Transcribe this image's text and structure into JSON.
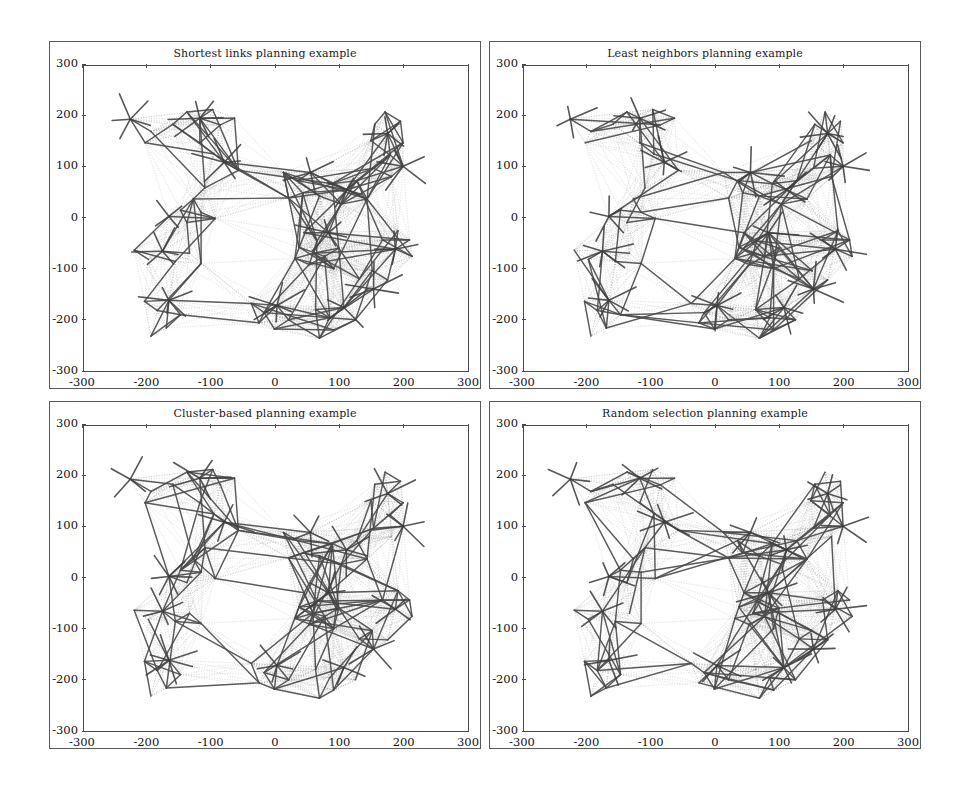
{
  "figure": {
    "width": 961,
    "height": 792,
    "background": "#ffffff",
    "line_color_solid": "#4a4a4a",
    "line_color_dotted": "#8d8d8d",
    "axis_color": "#4a4a4a"
  },
  "panels": [
    {
      "id": "shortest-links",
      "title": "Shortest links planning example",
      "position": "top-left"
    },
    {
      "id": "least-neighbors",
      "title": "Least neighbors planning example",
      "position": "top-right"
    },
    {
      "id": "cluster-based",
      "title": "Cluster-based planning example",
      "position": "bottom-left"
    },
    {
      "id": "random-selection",
      "title": "Random selection planning example",
      "position": "bottom-right"
    }
  ],
  "axes": {
    "xticks": [
      -300,
      -200,
      -100,
      0,
      100,
      200,
      300
    ],
    "yticks": [
      300,
      200,
      100,
      0,
      -100,
      -200,
      -300
    ],
    "xtick_labels": [
      "-300",
      "-200",
      "-100",
      "0",
      "100",
      "200",
      "300"
    ],
    "ytick_labels": [
      "300",
      "200",
      "100",
      "0",
      "-100",
      "-200",
      "-300"
    ],
    "xlim": [
      -300,
      300
    ],
    "ylim": [
      -300,
      300
    ],
    "xlabel": "",
    "ylabel": "",
    "grid": false
  },
  "chart_data": {
    "type": "scatter",
    "subtitle": "",
    "xlabel": "",
    "ylabel": "",
    "xlim": [
      -300,
      300
    ],
    "ylim": [
      -300,
      300
    ],
    "grid": false,
    "legend": "none",
    "nodes": [
      {
        "id": 0,
        "x": -228,
        "y": 196,
        "cluster": 0
      },
      {
        "id": 1,
        "x": -196,
        "y": 172,
        "cluster": 0
      },
      {
        "id": 2,
        "x": -205,
        "y": 150,
        "cluster": 0
      },
      {
        "id": 3,
        "x": -162,
        "y": 186,
        "cluster": 0
      },
      {
        "id": 4,
        "x": -140,
        "y": 210,
        "cluster": 1
      },
      {
        "id": 5,
        "x": -120,
        "y": 198,
        "cluster": 1
      },
      {
        "id": 6,
        "x": -100,
        "y": 215,
        "cluster": 1
      },
      {
        "id": 7,
        "x": -88,
        "y": 185,
        "cluster": 1
      },
      {
        "id": 8,
        "x": -66,
        "y": 198,
        "cluster": 1
      },
      {
        "id": 9,
        "x": -120,
        "y": 150,
        "cluster": 1
      },
      {
        "id": 10,
        "x": -98,
        "y": 128,
        "cluster": 2
      },
      {
        "id": 11,
        "x": -82,
        "y": 112,
        "cluster": 2
      },
      {
        "id": 12,
        "x": -60,
        "y": 96,
        "cluster": 2
      },
      {
        "id": 13,
        "x": -112,
        "y": 62,
        "cluster": 3
      },
      {
        "id": 14,
        "x": -130,
        "y": 40,
        "cluster": 3
      },
      {
        "id": 15,
        "x": -150,
        "y": 18,
        "cluster": 3
      },
      {
        "id": 16,
        "x": -168,
        "y": 6,
        "cluster": 3
      },
      {
        "id": 17,
        "x": -140,
        "y": -6,
        "cluster": 3
      },
      {
        "id": 18,
        "x": -118,
        "y": 14,
        "cluster": 3
      },
      {
        "id": 19,
        "x": -96,
        "y": 2,
        "cluster": 3
      },
      {
        "id": 20,
        "x": -222,
        "y": -60,
        "cluster": 4
      },
      {
        "id": 21,
        "x": -200,
        "y": -78,
        "cluster": 4
      },
      {
        "id": 22,
        "x": -178,
        "y": -62,
        "cluster": 4
      },
      {
        "id": 23,
        "x": -158,
        "y": -82,
        "cluster": 4
      },
      {
        "id": 24,
        "x": -136,
        "y": -66,
        "cluster": 4
      },
      {
        "id": 25,
        "x": -118,
        "y": -86,
        "cluster": 4
      },
      {
        "id": 26,
        "x": -206,
        "y": -160,
        "cluster": 5
      },
      {
        "id": 27,
        "x": -186,
        "y": -178,
        "cluster": 5
      },
      {
        "id": 28,
        "x": -168,
        "y": -158,
        "cluster": 5
      },
      {
        "id": 29,
        "x": -150,
        "y": -186,
        "cluster": 5
      },
      {
        "id": 30,
        "x": -172,
        "y": -212,
        "cluster": 5
      },
      {
        "id": 31,
        "x": -196,
        "y": -228,
        "cluster": 5
      },
      {
        "id": 32,
        "x": -40,
        "y": -164,
        "cluster": 6
      },
      {
        "id": 33,
        "x": -20,
        "y": -182,
        "cluster": 6
      },
      {
        "id": 34,
        "x": 0,
        "y": -168,
        "cluster": 6
      },
      {
        "id": 35,
        "x": 18,
        "y": -196,
        "cluster": 6
      },
      {
        "id": 36,
        "x": -4,
        "y": -214,
        "cluster": 6
      },
      {
        "id": 37,
        "x": -28,
        "y": -202,
        "cluster": 6
      },
      {
        "id": 38,
        "x": 60,
        "y": -176,
        "cluster": 7
      },
      {
        "id": 39,
        "x": 82,
        "y": -192,
        "cluster": 7
      },
      {
        "id": 40,
        "x": 104,
        "y": -172,
        "cluster": 7
      },
      {
        "id": 41,
        "x": 88,
        "y": -216,
        "cluster": 7
      },
      {
        "id": 42,
        "x": 66,
        "y": -232,
        "cluster": 7
      },
      {
        "id": 43,
        "x": 122,
        "y": -196,
        "cluster": 7
      },
      {
        "id": 44,
        "x": 10,
        "y": 92,
        "cluster": 8
      },
      {
        "id": 45,
        "x": 32,
        "y": 76,
        "cluster": 8
      },
      {
        "id": 46,
        "x": 52,
        "y": 92,
        "cluster": 8
      },
      {
        "id": 47,
        "x": 40,
        "y": 52,
        "cluster": 8
      },
      {
        "id": 48,
        "x": 18,
        "y": 42,
        "cluster": 8
      },
      {
        "id": 49,
        "x": 66,
        "y": 46,
        "cluster": 8
      },
      {
        "id": 50,
        "x": 86,
        "y": 70,
        "cluster": 9
      },
      {
        "id": 51,
        "x": 108,
        "y": 58,
        "cluster": 9
      },
      {
        "id": 52,
        "x": 124,
        "y": 76,
        "cluster": 9
      },
      {
        "id": 53,
        "x": 100,
        "y": 30,
        "cluster": 9
      },
      {
        "id": 54,
        "x": 140,
        "y": 40,
        "cluster": 9
      },
      {
        "id": 55,
        "x": 42,
        "y": -26,
        "cluster": 10
      },
      {
        "id": 56,
        "x": 62,
        "y": -42,
        "cluster": 10
      },
      {
        "id": 57,
        "x": 80,
        "y": -26,
        "cluster": 10
      },
      {
        "id": 58,
        "x": 56,
        "y": -66,
        "cluster": 10
      },
      {
        "id": 59,
        "x": 34,
        "y": -54,
        "cluster": 10
      },
      {
        "id": 60,
        "x": 74,
        "y": -72,
        "cluster": 10
      },
      {
        "id": 61,
        "x": 96,
        "y": -56,
        "cluster": 10
      },
      {
        "id": 62,
        "x": 50,
        "y": -88,
        "cluster": 10
      },
      {
        "id": 63,
        "x": 28,
        "y": -76,
        "cluster": 10
      },
      {
        "id": 64,
        "x": 88,
        "y": -96,
        "cluster": 10
      },
      {
        "id": 65,
        "x": 152,
        "y": 186,
        "cluster": 11
      },
      {
        "id": 66,
        "x": 172,
        "y": 168,
        "cluster": 11
      },
      {
        "id": 67,
        "x": 192,
        "y": 192,
        "cluster": 11
      },
      {
        "id": 68,
        "x": 168,
        "y": 210,
        "cluster": 11
      },
      {
        "id": 69,
        "x": 146,
        "y": 154,
        "cluster": 11
      },
      {
        "id": 70,
        "x": 196,
        "y": 150,
        "cluster": 11
      },
      {
        "id": 71,
        "x": 176,
        "y": 126,
        "cluster": 12
      },
      {
        "id": 72,
        "x": 196,
        "y": 104,
        "cluster": 12
      },
      {
        "id": 73,
        "x": 178,
        "y": 84,
        "cluster": 12
      },
      {
        "id": 74,
        "x": 150,
        "y": 100,
        "cluster": 12
      },
      {
        "id": 75,
        "x": 188,
        "y": -22,
        "cluster": 13
      },
      {
        "id": 76,
        "x": 206,
        "y": -40,
        "cluster": 13
      },
      {
        "id": 77,
        "x": 184,
        "y": -58,
        "cluster": 13
      },
      {
        "id": 78,
        "x": 164,
        "y": -40,
        "cluster": 13
      },
      {
        "id": 79,
        "x": 210,
        "y": -72,
        "cluster": 13
      },
      {
        "id": 80,
        "x": 148,
        "y": -100,
        "cluster": 14
      },
      {
        "id": 81,
        "x": 128,
        "y": -116,
        "cluster": 14
      },
      {
        "id": 82,
        "x": 150,
        "y": -136,
        "cluster": 14
      },
      {
        "id": 83,
        "x": 172,
        "y": -118,
        "cluster": 14
      }
    ],
    "hubs": [
      0,
      5,
      11,
      16,
      22,
      28,
      34,
      40,
      46,
      51,
      57,
      66,
      72,
      77,
      82
    ]
  }
}
